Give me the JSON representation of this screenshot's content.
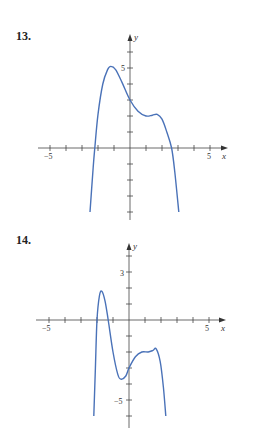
{
  "chart_data": [
    {
      "type": "line",
      "title": "13.",
      "xlabel": "x",
      "ylabel": "y",
      "xlim": [
        -5.5,
        5.8
      ],
      "ylim": [
        -4.3,
        7
      ],
      "x_tick_labels": [
        {
          "value": -5,
          "label": "−5"
        },
        {
          "value": 5,
          "label": "5"
        }
      ],
      "y_tick_labels": [
        {
          "value": 5,
          "label": "5"
        }
      ],
      "x_ticks": [
        -5,
        -4,
        -3,
        -2,
        -1,
        1,
        2,
        3,
        4,
        5
      ],
      "y_ticks": [
        -4,
        -3,
        -2,
        -1,
        1,
        2,
        3,
        4,
        5,
        6
      ],
      "grid": false,
      "series": [
        {
          "name": "f(x)",
          "color": "#4a72b8",
          "points": [
            [
              -2.5,
              -4
            ],
            [
              -2.3,
              -1.2
            ],
            [
              -2.2,
              0
            ],
            [
              -2.0,
              2.1
            ],
            [
              -1.7,
              4.0
            ],
            [
              -1.4,
              4.9
            ],
            [
              -1.2,
              5.1
            ],
            [
              -0.9,
              4.9
            ],
            [
              -0.5,
              4.1
            ],
            [
              0,
              3.0
            ],
            [
              0.5,
              2.3
            ],
            [
              1.0,
              2.0
            ],
            [
              1.4,
              2.05
            ],
            [
              1.7,
              2.1
            ],
            [
              2.0,
              1.8
            ],
            [
              2.3,
              1.0
            ],
            [
              2.6,
              0
            ],
            [
              2.8,
              -1.5
            ],
            [
              3.05,
              -4
            ]
          ]
        }
      ]
    },
    {
      "type": "line",
      "title": "14.",
      "xlabel": "x",
      "ylabel": "y",
      "xlim": [
        -5.5,
        5.8
      ],
      "ylim": [
        -6.5,
        4.8
      ],
      "x_tick_labels": [
        {
          "value": -5,
          "label": "−5"
        },
        {
          "value": 5,
          "label": "5"
        }
      ],
      "y_tick_labels": [
        {
          "value": 3,
          "label": "3"
        },
        {
          "value": -5,
          "label": "−5"
        }
      ],
      "x_ticks": [
        -5,
        -4,
        -3,
        -2,
        -1,
        1,
        2,
        3,
        4,
        5
      ],
      "y_ticks": [
        -6,
        -5,
        -4,
        -3,
        -2,
        -1,
        1,
        2,
        3,
        4
      ],
      "grid": false,
      "series": [
        {
          "name": "g(x)",
          "color": "#4a72b8",
          "points": [
            [
              -2.2,
              -6
            ],
            [
              -2.1,
              -3
            ],
            [
              -2.0,
              0
            ],
            [
              -1.85,
              1.5
            ],
            [
              -1.7,
              1.8
            ],
            [
              -1.5,
              1.2
            ],
            [
              -1.3,
              0
            ],
            [
              -1.0,
              -2.0
            ],
            [
              -0.7,
              -3.4
            ],
            [
              -0.5,
              -3.7
            ],
            [
              -0.2,
              -3.5
            ],
            [
              0,
              -3.0
            ],
            [
              0.4,
              -2.3
            ],
            [
              0.8,
              -2.0
            ],
            [
              1.2,
              -2.0
            ],
            [
              1.5,
              -1.9
            ],
            [
              1.7,
              -1.8
            ],
            [
              1.95,
              -2.6
            ],
            [
              2.15,
              -4.2
            ],
            [
              2.3,
              -6
            ]
          ]
        }
      ]
    }
  ],
  "problems": [
    {
      "number_label": "13."
    },
    {
      "number_label": "14."
    }
  ],
  "axis_labels": {
    "x": "x",
    "y": "y"
  },
  "tick_labels": {
    "p13": {
      "xneg": "−5",
      "xpos": "5",
      "y5": "5"
    },
    "p14": {
      "xneg": "−5",
      "xpos": "5",
      "y3": "3",
      "yneg5": "−5"
    }
  }
}
